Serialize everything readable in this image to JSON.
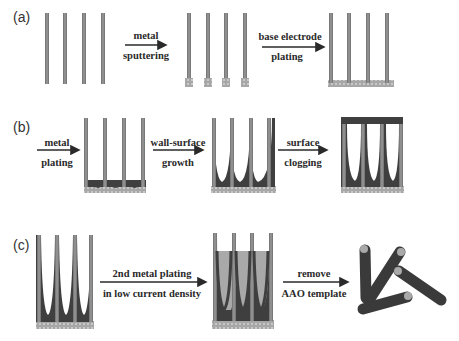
{
  "figure": {
    "panels": [
      {
        "label": "(a)",
        "steps": [
          {
            "lines": [
              "metal",
              "sputtering"
            ]
          },
          {
            "lines": [
              "base electrode",
              "plating"
            ]
          }
        ]
      },
      {
        "label": "(b)",
        "steps": [
          {
            "lines": [
              "metal",
              "plating"
            ]
          },
          {
            "lines": [
              "wall-surface",
              "growth"
            ]
          },
          {
            "lines": [
              "surface",
              "clogging"
            ]
          }
        ]
      },
      {
        "label": "(c)",
        "steps": [
          {
            "lines": [
              "2nd metal plating",
              "in low current density"
            ]
          },
          {
            "lines": [
              "remove",
              "AAO template"
            ]
          }
        ]
      }
    ],
    "colors": {
      "template_wall": "#8a8a8a",
      "template_wall_edge": "#5e5e5e",
      "metal_fill": "#3f3f3f",
      "second_metal": "#a9a9a9",
      "electrode_pattern": "#9a9a9a",
      "arrow": "#2a2a2a",
      "text": "#2a2a2a"
    }
  }
}
